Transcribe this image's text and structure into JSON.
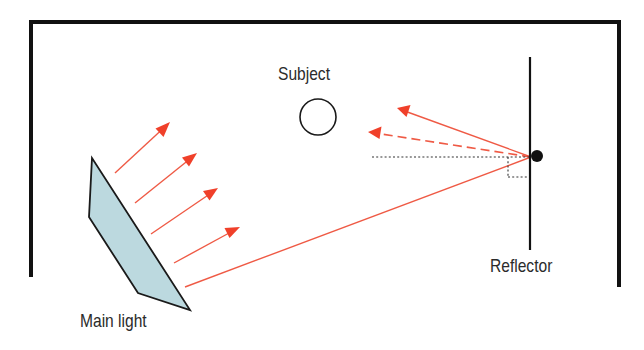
{
  "diagram": {
    "labels": {
      "subject": "Subject",
      "main_light": "Main light",
      "reflector": "Reflector"
    },
    "colors": {
      "frame": "#111111",
      "light_ray": "#ef5a45",
      "arrowhead": "#f0402a",
      "light_fill": "#bcd9df",
      "light_outline": "#1a1a1a",
      "text": "#2b2b2b",
      "dotted_guide": "#333333"
    },
    "elements": {
      "room_frame": {
        "left_x": 31,
        "right_x": 619,
        "top_y": 22,
        "left_bottom_y": 277,
        "right_bottom_y": 287
      },
      "subject_circle": {
        "cx": 318,
        "cy": 117,
        "r": 18
      },
      "main_light_polygon": [
        [
          92,
          158
        ],
        [
          89,
          217
        ],
        [
          138,
          293
        ],
        [
          190,
          310
        ]
      ],
      "reflector_line": {
        "x": 530,
        "y1": 57,
        "y2": 250
      },
      "reflector_point": {
        "cx": 537,
        "cy": 156,
        "r": 6
      },
      "incident_rays": [
        {
          "from": [
            115,
            173
          ],
          "to": [
            170,
            122
          ]
        },
        {
          "from": [
            135,
            203
          ],
          "to": [
            197,
            153
          ]
        },
        {
          "from": [
            151,
            234
          ],
          "to": [
            218,
            188
          ]
        },
        {
          "from": [
            174,
            263
          ],
          "to": [
            240,
            227
          ]
        }
      ],
      "ray_to_reflector": {
        "from": [
          185,
          287
        ],
        "to": [
          531,
          157
        ]
      },
      "reflected_ray_solid": {
        "from": [
          531,
          157
        ],
        "to": [
          397,
          108
        ]
      },
      "reflected_ray_dashed": {
        "from": [
          531,
          157
        ],
        "to": [
          368,
          132
        ]
      },
      "normal_guide": {
        "y": 157,
        "x1": 372,
        "x2": 530
      },
      "right_angle_marker": {
        "x1": 508,
        "x2": 530,
        "y1": 157,
        "y2": 177
      }
    }
  }
}
